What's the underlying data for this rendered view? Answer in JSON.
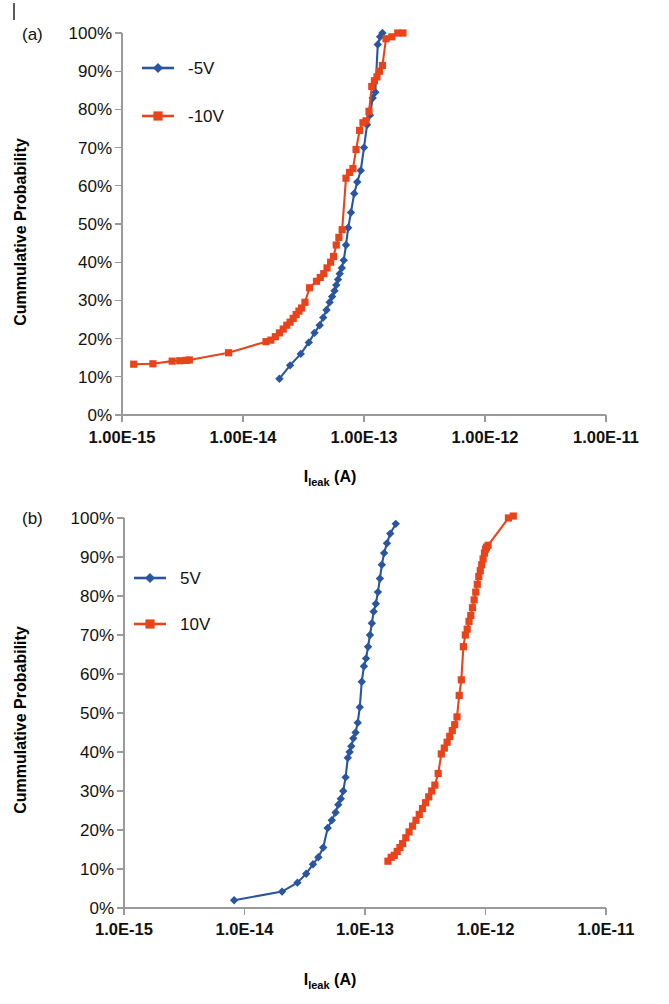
{
  "figure": {
    "background": "#ffffff",
    "scan_artifact": "vertical-tick-mark"
  },
  "colors": {
    "series_blue": "#2A55A0",
    "series_red": "#E8441C",
    "axis": "#9a9a9a",
    "text": "#111111"
  },
  "panels": [
    {
      "id": "a",
      "panel_label": "(a)",
      "ylabel": "Cummulative Probability",
      "xlabel_main": "I",
      "xlabel_sub": "leak",
      "xlabel_tail": " (A)",
      "xticklabels": [
        "1.00E-15",
        "1.00E-14",
        "1.00E-13",
        "1.00E-12",
        "1.00E-11"
      ],
      "yticklabels": [
        "0%",
        "10%",
        "20%",
        "30%",
        "40%",
        "50%",
        "60%",
        "70%",
        "80%",
        "90%",
        "100%"
      ],
      "legend": [
        {
          "label": "-5V",
          "color": "#2A55A0",
          "marker": "diamond"
        },
        {
          "label": "-10V",
          "color": "#E8441C",
          "marker": "square"
        }
      ]
    },
    {
      "id": "b",
      "panel_label": "(b)",
      "ylabel": "Cummulative Probability",
      "xlabel_main": "I",
      "xlabel_sub": "leak",
      "xlabel_tail": " (A)",
      "xticklabels": [
        "1.0E-15",
        "1.0E-14",
        "1.0E-13",
        "1.0E-12",
        "1.0E-11"
      ],
      "yticklabels": [
        "0%",
        "10%",
        "20%",
        "30%",
        "40%",
        "50%",
        "60%",
        "70%",
        "80%",
        "90%",
        "100%"
      ],
      "legend": [
        {
          "label": "5V",
          "color": "#2A55A0",
          "marker": "diamond"
        },
        {
          "label": "10V",
          "color": "#E8441C",
          "marker": "square"
        }
      ]
    }
  ],
  "chart_data": [
    {
      "type": "line",
      "panel": "(a)",
      "title": "",
      "xlabel": "I_leak (A)",
      "ylabel": "Cummulative Probability",
      "xscale": "log",
      "xlim": [
        1e-15,
        1e-11
      ],
      "ylim": [
        0,
        100
      ],
      "xticks": [
        1e-15,
        1e-14,
        1e-13,
        1e-12,
        1e-11
      ],
      "xticklabels": [
        "1.00E-15",
        "1.00E-14",
        "1.00E-13",
        "1.00E-12",
        "1.00E-11"
      ],
      "yticks": [
        0,
        10,
        20,
        30,
        40,
        50,
        60,
        70,
        80,
        90,
        100
      ],
      "yticklabels": [
        "0%",
        "10%",
        "20%",
        "30%",
        "40%",
        "50%",
        "60%",
        "70%",
        "80%",
        "90%",
        "100%"
      ],
      "grid": false,
      "legend_position": "upper-left-inside",
      "series": [
        {
          "name": "-5V",
          "color": "#2A55A0",
          "marker": "diamond",
          "x": [
            2e-14,
            2.45e-14,
            3e-14,
            3.5e-14,
            3.9e-14,
            4.3e-14,
            4.6e-14,
            4.9e-14,
            5.2e-14,
            5.45e-14,
            5.7e-14,
            5.9e-14,
            6.1e-14,
            6.3e-14,
            6.55e-14,
            6.8e-14,
            7.1e-14,
            7.4e-14,
            7.8e-14,
            8.3e-14,
            8.8e-14,
            9.4e-14,
            1e-13,
            1.06e-13,
            1.12e-13,
            1.18e-13,
            1.24e-13,
            1.3e-13,
            1.36e-13,
            1.42e-13
          ],
          "y": [
            9.5,
            13.0,
            16.0,
            19.0,
            21.5,
            23.5,
            25.5,
            27.5,
            29.5,
            31.0,
            32.5,
            34.0,
            35.5,
            37.0,
            38.5,
            40.5,
            44.5,
            49.0,
            53.0,
            58.0,
            61.0,
            64.0,
            70.0,
            76.0,
            78.5,
            83.0,
            84.5,
            97.0,
            99.0,
            100.0
          ]
        },
        {
          "name": "-10V",
          "color": "#E8441C",
          "marker": "square",
          "x": [
            1.25e-15,
            1.8e-15,
            2.6e-15,
            3e-15,
            3.4e-15,
            3.6e-15,
            7.6e-15,
            1.55e-14,
            1.7e-14,
            1.85e-14,
            2e-14,
            2.15e-14,
            2.3e-14,
            2.45e-14,
            2.6e-14,
            2.75e-14,
            2.9e-14,
            3.05e-14,
            3.25e-14,
            3.55e-14,
            4.05e-14,
            4.35e-14,
            4.65e-14,
            4.95e-14,
            5.3e-14,
            5.6e-14,
            5.9e-14,
            6.2e-14,
            6.6e-14,
            7.1e-14,
            7.6e-14,
            8.1e-14,
            8.6e-14,
            9.2e-14,
            9.8e-14,
            1.04e-13,
            1.1e-13,
            1.16e-13,
            1.22e-13,
            1.28e-13,
            1.34e-13,
            1.42e-13,
            1.52e-13,
            1.7e-13,
            1.9e-13,
            2.1e-13
          ],
          "y": [
            13.3,
            13.4,
            14.1,
            14.2,
            14.3,
            14.4,
            16.3,
            19.2,
            19.6,
            20.5,
            21.5,
            22.5,
            23.5,
            24.3,
            25.3,
            26.3,
            27.2,
            28.0,
            29.5,
            33.3,
            35.0,
            36.0,
            37.0,
            38.5,
            40.0,
            41.5,
            44.5,
            46.5,
            48.5,
            62.0,
            63.5,
            64.5,
            69.5,
            74.5,
            76.5,
            77.0,
            79.5,
            86.0,
            87.5,
            88.5,
            90.0,
            91.5,
            98.5,
            99.0,
            100.0,
            100.0
          ]
        }
      ]
    },
    {
      "type": "line",
      "panel": "(b)",
      "title": "",
      "xlabel": "I_leak (A)",
      "ylabel": "Cummulative Probability",
      "xscale": "log",
      "xlim": [
        1e-15,
        1e-11
      ],
      "ylim": [
        0,
        100
      ],
      "xticks": [
        1e-15,
        1e-14,
        1e-13,
        1e-12,
        1e-11
      ],
      "xticklabels": [
        "1.0E-15",
        "1.0E-14",
        "1.0E-13",
        "1.0E-12",
        "1.0E-11"
      ],
      "yticks": [
        0,
        10,
        20,
        30,
        40,
        50,
        60,
        70,
        80,
        90,
        100
      ],
      "yticklabels": [
        "0%",
        "10%",
        "20%",
        "30%",
        "40%",
        "50%",
        "60%",
        "70%",
        "80%",
        "90%",
        "100%"
      ],
      "grid": false,
      "legend_position": "upper-left-inside",
      "series": [
        {
          "name": "5V",
          "color": "#2A55A0",
          "marker": "diamond",
          "x": [
            8.2e-15,
            2.05e-14,
            2.75e-14,
            3.25e-14,
            3.7e-14,
            4.1e-14,
            4.5e-14,
            4.9e-14,
            5.3e-14,
            5.7e-14,
            6e-14,
            6.3e-14,
            6.6e-14,
            6.9e-14,
            7.2e-14,
            7.45e-14,
            7.7e-14,
            8e-14,
            8.35e-14,
            8.7e-14,
            9.05e-14,
            9.4e-14,
            9.8e-14,
            1.02e-13,
            1.06e-13,
            1.1e-13,
            1.14e-13,
            1.18e-13,
            1.23e-13,
            1.28e-13,
            1.33e-13,
            1.38e-13,
            1.44e-13,
            1.52e-13,
            1.62e-13,
            1.8e-13
          ],
          "y": [
            2.0,
            4.2,
            6.5,
            8.8,
            11.2,
            13.0,
            15.5,
            20.5,
            22.5,
            24.5,
            26.5,
            28.0,
            30.0,
            33.5,
            38.5,
            40.0,
            41.5,
            43.5,
            45.0,
            47.5,
            51.5,
            58.0,
            62.0,
            64.0,
            67.0,
            70.0,
            73.0,
            76.0,
            78.0,
            81.0,
            84.5,
            88.0,
            91.0,
            93.5,
            96.0,
            98.5
          ]
        },
        {
          "name": "10V",
          "color": "#E8441C",
          "marker": "square",
          "x": [
            1.55e-13,
            1.65e-13,
            1.75e-13,
            1.85e-13,
            1.95e-13,
            2.05e-13,
            2.18e-13,
            2.32e-13,
            2.48e-13,
            2.65e-13,
            2.82e-13,
            3e-13,
            3.18e-13,
            3.38e-13,
            3.58e-13,
            3.8e-13,
            4.05e-13,
            4.3e-13,
            4.55e-13,
            4.8e-13,
            5.05e-13,
            5.3e-13,
            5.55e-13,
            5.8e-13,
            6.05e-13,
            6.3e-13,
            6.55e-13,
            6.8e-13,
            7.05e-13,
            7.3e-13,
            7.55e-13,
            7.8e-13,
            8.05e-13,
            8.3e-13,
            8.55e-13,
            8.8e-13,
            9.05e-13,
            9.3e-13,
            9.55e-13,
            9.8e-13,
            1e-12,
            1.02e-12,
            1.05e-12,
            1.55e-12,
            1.7e-12
          ],
          "y": [
            12.0,
            13.0,
            13.5,
            14.5,
            15.5,
            16.5,
            18.0,
            19.5,
            21.0,
            22.5,
            24.0,
            25.5,
            27.0,
            28.5,
            30.0,
            31.5,
            34.5,
            39.5,
            41.0,
            42.5,
            44.0,
            45.5,
            47.0,
            49.0,
            54.5,
            58.5,
            67.0,
            70.0,
            71.5,
            73.5,
            75.0,
            77.0,
            79.0,
            81.0,
            83.0,
            85.0,
            86.5,
            88.0,
            89.5,
            91.0,
            92.0,
            92.5,
            93.0,
            100.0,
            100.5
          ]
        }
      ]
    }
  ]
}
